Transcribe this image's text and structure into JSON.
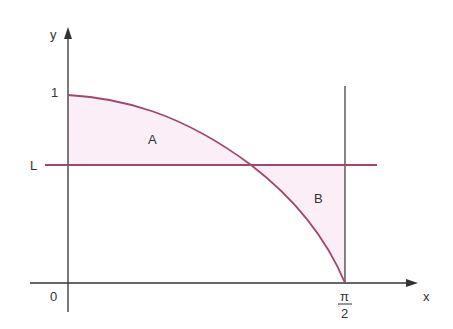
{
  "diagram": {
    "axes": {
      "x_label": "x",
      "y_label": "y",
      "origin_label": "0"
    },
    "y_ticks": {
      "one": "1",
      "L": "L"
    },
    "x_ticks": {
      "pi_over_2_numerator": "π",
      "pi_over_2_denominator": "2"
    },
    "regions": {
      "A": "A",
      "B": "B"
    },
    "colors": {
      "curve": "#a2456f",
      "fill": "#fbeef6",
      "axis": "#333333"
    }
  }
}
